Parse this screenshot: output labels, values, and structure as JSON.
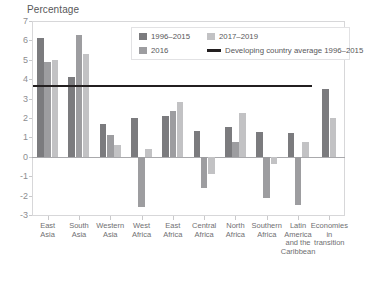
{
  "chart_data": {
    "type": "bar",
    "title": "",
    "ylabel": "Percentage",
    "xlabel": "",
    "ylim": [
      -3,
      7
    ],
    "yticks": [
      7,
      6,
      5,
      4,
      3,
      2,
      1,
      0,
      -1,
      -2,
      -3
    ],
    "ytick_labels": [
      "7",
      "6",
      "5",
      "4",
      "3",
      "2",
      "1",
      "0",
      "-1",
      "-2",
      "-3"
    ],
    "grid": false,
    "legend_position": "top-center",
    "categories": [
      "East\nAsia",
      "South\nAsia",
      "Western\nAsia",
      "West\nAfrica",
      "East\nAfrica",
      "Central\nAfrica",
      "North\nAfrica",
      "Southern\nAfrica",
      "Latin\nAmerica\nand the\nCaribbean",
      "Economies\nin\ntransition"
    ],
    "series": [
      {
        "name": "1996–2015",
        "color": "#7b7b7e",
        "values": [
          6.1,
          4.1,
          1.7,
          2.0,
          2.1,
          1.35,
          1.55,
          1.3,
          1.25,
          3.5
        ]
      },
      {
        "name": "2016",
        "color": "#9d9da0",
        "values": [
          4.9,
          6.3,
          1.1,
          -2.6,
          2.35,
          -1.6,
          0.75,
          -2.1,
          -2.5,
          null
        ]
      },
      {
        "name": "2017–2019",
        "color": "#c2c2c4",
        "values": [
          5.0,
          5.3,
          0.6,
          0.4,
          2.85,
          -0.9,
          2.25,
          -0.35,
          0.75,
          2.0
        ]
      }
    ],
    "reference_line": {
      "label": "Developing country average 1996–2015",
      "value": 3.7,
      "color": "#231f20",
      "x_start_category_index": 0,
      "x_end_category_index": 8
    },
    "legend_entries": [
      {
        "label": "1996–2015",
        "marker": "square",
        "color": "#7b7b7e"
      },
      {
        "label": "2016",
        "marker": "square",
        "color": "#9d9da0"
      },
      {
        "label": "2017–2019",
        "marker": "square",
        "color": "#c2c2c4"
      },
      {
        "label": "Developing country average 1996–2015",
        "marker": "line",
        "color": "#231f20"
      }
    ]
  }
}
